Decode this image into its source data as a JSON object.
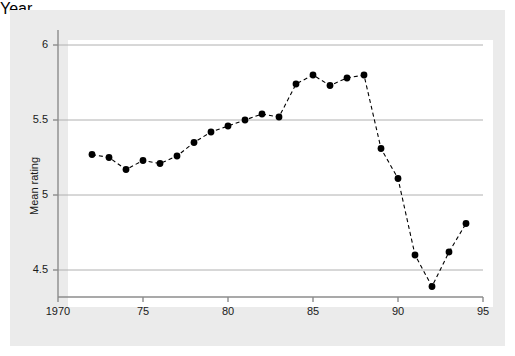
{
  "chart_data": {
    "type": "line",
    "title": "",
    "xlabel": "Year",
    "ylabel": "Mean rating",
    "xlim": [
      1970,
      1995
    ],
    "ylim": [
      4.32,
      6.1
    ],
    "xticks": [
      1970,
      1975,
      1980,
      1985,
      1990,
      1995
    ],
    "xticklabels": [
      "1970",
      "75",
      "80",
      "85",
      "90",
      "95"
    ],
    "yticks": [
      4.5,
      5,
      5.5,
      6
    ],
    "yticklabels": [
      "4.5",
      "5",
      "5.5",
      "6"
    ],
    "grid": "horizontal",
    "legend": "none",
    "series": [
      {
        "name": "Mean rating",
        "marker": "filled-circle",
        "linestyle": "dashed",
        "color": "#000000",
        "x": [
          1972,
          1973,
          1974,
          1975,
          1976,
          1977,
          1978,
          1979,
          1980,
          1981,
          1982,
          1983,
          1984,
          1985,
          1986,
          1987,
          1988,
          1989,
          1990,
          1991,
          1992,
          1993,
          1994
        ],
        "y": [
          5.27,
          5.25,
          5.17,
          5.23,
          5.21,
          5.26,
          5.35,
          5.42,
          5.46,
          5.5,
          5.54,
          5.52,
          5.74,
          5.8,
          5.73,
          5.78,
          5.8,
          5.31,
          5.11,
          4.6,
          4.39,
          4.62,
          4.81
        ]
      }
    ]
  },
  "style": {
    "outer_background": "#ffffff",
    "panel_background": "#ebebeb",
    "plot_background": "#ffffff",
    "grid_color": "#b0b0b0",
    "axis_color": "#8c8c8c",
    "text_color": "#1a1a1a",
    "series_color": "#000000"
  }
}
